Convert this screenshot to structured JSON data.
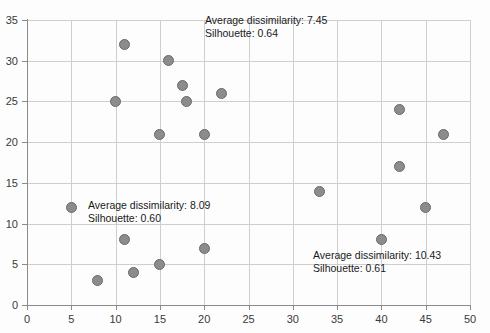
{
  "chart_data": {
    "type": "scatter",
    "title": "",
    "xlabel": "",
    "ylabel": "",
    "xlim": [
      0,
      50
    ],
    "ylim": [
      0,
      35
    ],
    "xticks": [
      0,
      5,
      10,
      15,
      20,
      25,
      30,
      35,
      40,
      45,
      50
    ],
    "yticks": [
      0,
      5,
      10,
      15,
      20,
      25,
      30,
      35
    ],
    "grid": true,
    "legend": "none",
    "marker_color": "#8c8c8c",
    "marker_edge_color": "#6a6a6a",
    "gridline_color": "#cfcfcf",
    "axis_color": "#8a8a8a",
    "points": [
      {
        "x": 5,
        "y": 12
      },
      {
        "x": 8,
        "y": 3
      },
      {
        "x": 10,
        "y": 25
      },
      {
        "x": 11,
        "y": 32
      },
      {
        "x": 11,
        "y": 8
      },
      {
        "x": 12,
        "y": 4
      },
      {
        "x": 15,
        "y": 5
      },
      {
        "x": 15,
        "y": 21
      },
      {
        "x": 16,
        "y": 30
      },
      {
        "x": 17.5,
        "y": 27
      },
      {
        "x": 18,
        "y": 25
      },
      {
        "x": 20,
        "y": 21
      },
      {
        "x": 20,
        "y": 7
      },
      {
        "x": 22,
        "y": 26
      },
      {
        "x": 33,
        "y": 14
      },
      {
        "x": 40,
        "y": 8
      },
      {
        "x": 42,
        "y": 24
      },
      {
        "x": 42,
        "y": 17
      },
      {
        "x": 45,
        "y": 12
      },
      {
        "x": 47,
        "y": 21
      }
    ],
    "annotations": [
      {
        "id": "cluster-top",
        "line1": "Average dissimilarity: 7.45",
        "line2": "Silhouette: 0.64",
        "x_px": 205,
        "y_px": 14
      },
      {
        "id": "cluster-left",
        "line1": "Average dissimilarity: 8.09",
        "line2": "Silhouette: 0.60",
        "x_px": 88,
        "y_px": 199
      },
      {
        "id": "cluster-right",
        "line1": "Average dissimilarity: 10.43",
        "line2": "Silhouette: 0.61",
        "x_px": 313,
        "y_px": 249
      }
    ]
  }
}
